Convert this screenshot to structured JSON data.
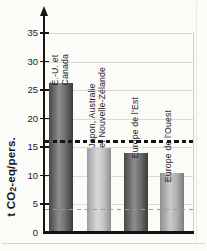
{
  "figure": {
    "background": "#fbfbf8",
    "scan_edge_color": "#d6d6d2"
  },
  "chart_data": {
    "type": "bar",
    "title": "",
    "ylabel": {
      "prefix": "t CO",
      "sub": "2",
      "suffix": "-eq/pers."
    },
    "ylim": [
      0,
      37
    ],
    "yticks": [
      0,
      5,
      10,
      15,
      20,
      25,
      30,
      35
    ],
    "grid": true,
    "legend": "none",
    "categories": [
      "É.-U. et Canada",
      "Japon, Australie et Nouvelle-Zélande",
      "Europe de l’Est",
      "Europe de l’Ouest"
    ],
    "bars": [
      {
        "label_lines": [
          "É.-U. et",
          "Canada"
        ],
        "value": 26.2,
        "shade": "dark"
      },
      {
        "label_lines": [
          "Japon, Australie",
          "et Nouvelle-Zélande"
        ],
        "value": 14.9,
        "shade": "light"
      },
      {
        "label_lines": [
          "Europe de l’Est"
        ],
        "value": 14.0,
        "shade": "dark"
      },
      {
        "label_lines": [
          "Europe de l’Ouest"
        ],
        "value": 10.4,
        "shade": "medium"
      }
    ],
    "reference_lines": [
      {
        "value": 16,
        "style": "bold-dashed",
        "color": "#141414"
      },
      {
        "value": 4,
        "style": "thin-dashed",
        "color": "#9a9a9a"
      }
    ],
    "palette": {
      "dark": [
        "#474747",
        "#8d8d8d",
        "#6e6e6e",
        "#3b3b3b"
      ],
      "light": [
        "#9e9e9e",
        "#d8d8d8",
        "#c6c6c6",
        "#8f8f8f"
      ],
      "medium": [
        "#8e8e8e",
        "#c9c9c9",
        "#b2b2b2",
        "#7d7d7d"
      ]
    },
    "axis_color": "#161616",
    "gridline_color": "#d9d9d9",
    "tick_label_color": "#222222"
  }
}
